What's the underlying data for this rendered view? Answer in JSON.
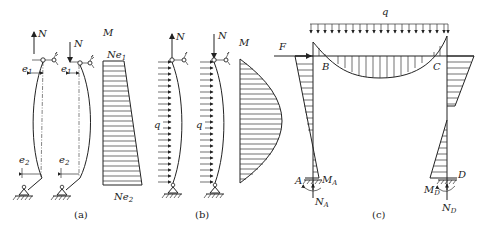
{
  "figure": {
    "panels": [
      {
        "id": "a",
        "caption": "(a)",
        "labels": {
          "axial_force_1": "N",
          "axial_force_2": "N",
          "eccentricity_top_1": "e1",
          "eccentricity_top_2": "e1",
          "eccentricity_bottom_1": "e2",
          "eccentricity_bottom_2": "e2",
          "moment_title": "M",
          "moment_top": "Ne1",
          "moment_bottom": "Ne2"
        },
        "description": "Eccentrically loaded pinned columns with unequal end eccentricities e1 and e2, trapezoidal moment diagram from Ne1 to Ne2"
      },
      {
        "id": "b",
        "caption": "(b)",
        "labels": {
          "axial_force_1": "N",
          "axial_force_2": "N",
          "distributed_load_1": "q",
          "distributed_load_2": "q",
          "moment_title": "M"
        },
        "description": "Pinned columns under axial force N and uniform lateral load q, parabolic moment diagram"
      },
      {
        "id": "c",
        "caption": "(c)",
        "labels": {
          "distributed_load": "q",
          "horizontal_force": "F",
          "joint_B": "B",
          "joint_C": "C",
          "support_A": "A",
          "support_D": "D",
          "moment_A": "MA",
          "moment_D": "MD",
          "axial_A": "NA",
          "axial_D": "ND"
        },
        "description": "Portal frame with fixed bases under uniform load q on beam and horizontal force F, bending moment diagram"
      }
    ]
  }
}
